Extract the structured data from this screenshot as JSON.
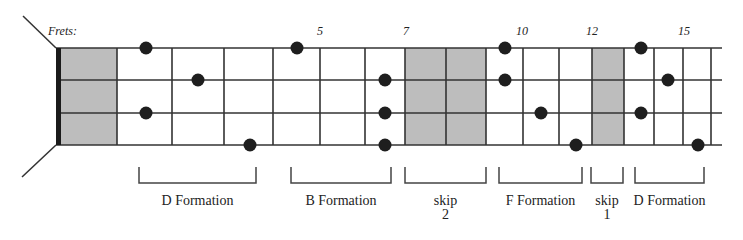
{
  "diagram": {
    "title_label": "Frets:",
    "colors": {
      "line": "#333333",
      "nut": "#1a1a1a",
      "shade": "#bdbdbd",
      "dot": "#1e1e1e",
      "text": "#222222"
    },
    "strings_y": [
      48,
      80,
      113,
      145
    ],
    "fret_x": [
      117,
      172,
      224,
      273,
      320,
      365,
      405,
      446,
      486,
      523,
      559,
      592,
      624,
      654,
      683,
      711
    ],
    "nut_x": 56,
    "string_end_x": 722,
    "fret_numbers": [
      {
        "label": "5",
        "x": 320
      },
      {
        "label": "7",
        "x": 406
      },
      {
        "label": "10",
        "x": 522
      },
      {
        "label": "12",
        "x": 592
      },
      {
        "label": "15",
        "x": 684
      }
    ],
    "shaded_regions": [
      {
        "name": "open-position",
        "x1": 61,
        "x2": 117
      },
      {
        "name": "skip-2-region",
        "x1": 405,
        "x2": 486
      },
      {
        "name": "skip-1-region",
        "x1": 592,
        "x2": 624
      }
    ],
    "dots": [
      {
        "x": 146,
        "y": 48
      },
      {
        "x": 198,
        "y": 80
      },
      {
        "x": 146,
        "y": 113
      },
      {
        "x": 250,
        "y": 145
      },
      {
        "x": 297,
        "y": 48
      },
      {
        "x": 385,
        "y": 80
      },
      {
        "x": 385,
        "y": 113
      },
      {
        "x": 385,
        "y": 145
      },
      {
        "x": 505,
        "y": 48
      },
      {
        "x": 505,
        "y": 80
      },
      {
        "x": 541,
        "y": 113
      },
      {
        "x": 576,
        "y": 145
      },
      {
        "x": 641,
        "y": 48
      },
      {
        "x": 668,
        "y": 80
      },
      {
        "x": 641,
        "y": 113
      },
      {
        "x": 698,
        "y": 145
      }
    ],
    "brackets": [
      {
        "lines": [
          "D Formation"
        ],
        "x1": 139,
        "x2": 256
      },
      {
        "lines": [
          "B Formation"
        ],
        "x1": 291,
        "x2": 391
      },
      {
        "lines": [
          "skip",
          "2"
        ],
        "x1": 405,
        "x2": 486
      },
      {
        "lines": [
          "F Formation"
        ],
        "x1": 499,
        "x2": 582
      },
      {
        "lines": [
          "skip",
          "1"
        ],
        "x1": 591,
        "x2": 623
      },
      {
        "lines": [
          "D Formation"
        ],
        "x1": 635,
        "x2": 704
      }
    ]
  }
}
